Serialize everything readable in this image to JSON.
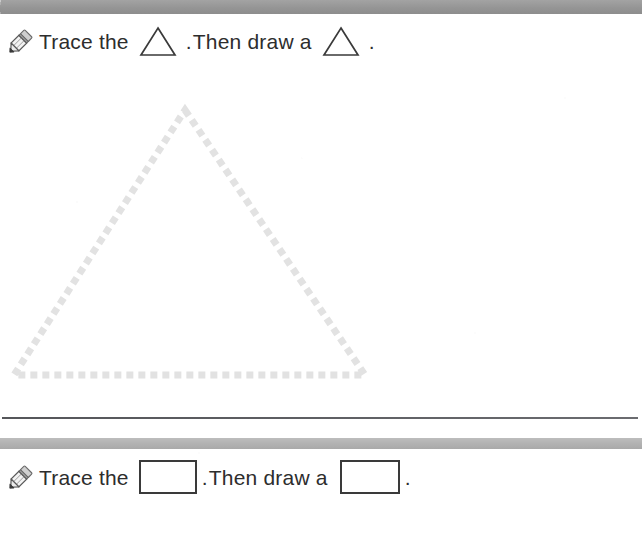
{
  "page": {
    "background_color": "#ffffff",
    "width": 642,
    "height": 546
  },
  "top_banner": {
    "name": "page-header-band",
    "color": "#9a9a9a"
  },
  "exercises": [
    {
      "id": "triangle-exercise",
      "icon": "pencil-icon",
      "lead_text": "Trace the",
      "shape": "triangle",
      "punctuation_after_shape": ".",
      "mid_text": "Then draw a",
      "draw_shape": "triangle",
      "end_punctuation": ".",
      "trace_shape": {
        "type": "triangle",
        "style": "dashed",
        "color": "#e2e2e2",
        "apex_x": 185,
        "apex_y": 110,
        "left_x": 14,
        "right_x": 365,
        "base_y": 375,
        "dash_length": 7,
        "dash_gap": 5,
        "stroke_width": 7
      }
    },
    {
      "id": "rectangle-exercise",
      "icon": "pencil-icon",
      "lead_text": "Trace the",
      "shape": "rectangle",
      "punctuation_after_shape": ".",
      "mid_text": "Then draw a",
      "draw_shape": "rectangle",
      "end_punctuation": ".",
      "trace_shape": null
    }
  ],
  "dividers": [
    {
      "name": "section-rule",
      "color": "#55565a",
      "y": 417,
      "thickness": 2
    },
    {
      "name": "section-band",
      "color": "#b4b4b4",
      "y": 438,
      "thickness": 11
    }
  ],
  "colors": {
    "text": "#2d2d2d",
    "shape_outline": "#3a3a3a",
    "dash_gray": "#e2e2e2",
    "banner_gray": "#9a9a9a",
    "rule_dark": "#55565a"
  }
}
